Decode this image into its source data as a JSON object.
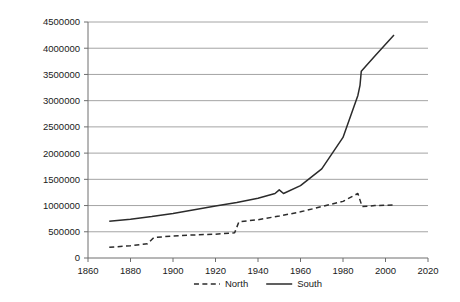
{
  "chart_data": {
    "type": "line",
    "title": "",
    "subtitle": "",
    "xlabel": "",
    "ylabel": "",
    "xlim": [
      1860,
      2020
    ],
    "ylim": [
      0,
      4500000
    ],
    "xticks": [
      1860,
      1880,
      1900,
      1920,
      1940,
      1960,
      1980,
      2000,
      2020
    ],
    "yticks": [
      0,
      500000,
      1000000,
      1500000,
      2000000,
      2500000,
      3000000,
      3500000,
      4000000,
      4500000
    ],
    "xtick_labels": [
      "1860",
      "1880",
      "1900",
      "1920",
      "1940",
      "1960",
      "1980",
      "2000",
      "2020"
    ],
    "ytick_labels": [
      "0",
      "500000",
      "1000000",
      "1500000",
      "2000000",
      "2500000",
      "3000000",
      "3500000",
      "4000000",
      "4500000"
    ],
    "grid": "horizontal",
    "legend_position": "bottom-center",
    "series": [
      {
        "name": "North",
        "style": "dashed",
        "color": "#2b2b2b",
        "points": [
          [
            1870,
            205000
          ],
          [
            1880,
            235000
          ],
          [
            1888,
            270000
          ],
          [
            1891,
            390000
          ],
          [
            1900,
            420000
          ],
          [
            1910,
            440000
          ],
          [
            1920,
            455000
          ],
          [
            1929,
            480000
          ],
          [
            1931,
            690000
          ],
          [
            1940,
            730000
          ],
          [
            1950,
            800000
          ],
          [
            1960,
            880000
          ],
          [
            1970,
            980000
          ],
          [
            1980,
            1080000
          ],
          [
            1987,
            1230000
          ],
          [
            1989,
            980000
          ],
          [
            1995,
            1000000
          ],
          [
            2004,
            1010000
          ]
        ]
      },
      {
        "name": "South",
        "style": "solid",
        "color": "#2b2b2b",
        "points": [
          [
            1870,
            700000
          ],
          [
            1880,
            740000
          ],
          [
            1890,
            790000
          ],
          [
            1900,
            850000
          ],
          [
            1910,
            920000
          ],
          [
            1920,
            990000
          ],
          [
            1930,
            1060000
          ],
          [
            1940,
            1140000
          ],
          [
            1948,
            1230000
          ],
          [
            1950,
            1300000
          ],
          [
            1952,
            1230000
          ],
          [
            1960,
            1380000
          ],
          [
            1970,
            1700000
          ],
          [
            1980,
            2300000
          ],
          [
            1987,
            3100000
          ],
          [
            1988,
            3290000
          ],
          [
            1988.6,
            3560000
          ],
          [
            1995,
            3850000
          ],
          [
            2004,
            4250000
          ]
        ]
      }
    ],
    "legend": [
      {
        "label": "North",
        "style": "dashed"
      },
      {
        "label": "South",
        "style": "solid"
      }
    ]
  }
}
